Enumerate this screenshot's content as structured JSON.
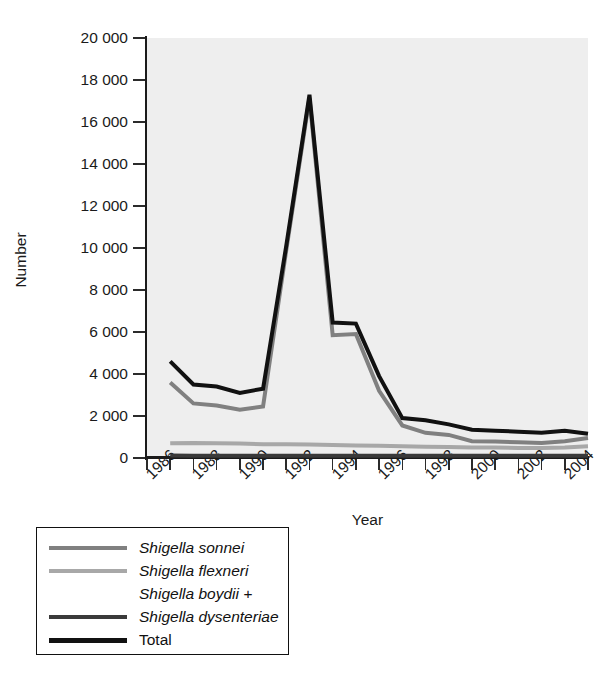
{
  "chart_data": {
    "type": "line",
    "title": "",
    "xlabel": "Year",
    "ylabel": "Number",
    "xlim": [
      1986,
      2005
    ],
    "ylim": [
      0,
      20000
    ],
    "grid": false,
    "legend_position": "below-left",
    "background": "#eeeeee",
    "x": [
      1987,
      1988,
      1989,
      1990,
      1991,
      1992,
      1993,
      1994,
      1995,
      1996,
      1997,
      1998,
      1999,
      2000,
      2001,
      2002,
      2003,
      2004,
      2005
    ],
    "xtick_labels": [
      "1986",
      "1988",
      "1990",
      "1992",
      "1994",
      "1996",
      "1998",
      "2000",
      "2002",
      "2004"
    ],
    "xtick_values": [
      1986,
      1988,
      1990,
      1992,
      1994,
      1996,
      1998,
      2000,
      2002,
      2004
    ],
    "xtick_all": [
      1986,
      1987,
      1988,
      1989,
      1990,
      1991,
      1992,
      1993,
      1994,
      1995,
      1996,
      1997,
      1998,
      1999,
      2000,
      2001,
      2002,
      2003,
      2004,
      2005
    ],
    "ytick_labels": [
      "0",
      "2000",
      "4000",
      "6000",
      "8000",
      "10000",
      "12000",
      "14000",
      "16000",
      "18000",
      "20000"
    ],
    "ytick_labels_display": [
      "0",
      "2 000",
      "4 000",
      "6 000",
      "8 000",
      "10 000",
      "12 000",
      "14 000",
      "16 000",
      "18 000",
      "20 000"
    ],
    "ytick_values": [
      0,
      2000,
      4000,
      6000,
      8000,
      10000,
      12000,
      14000,
      16000,
      18000,
      20000
    ],
    "series": [
      {
        "name": "Shigella sonnei",
        "italic": true,
        "color": "#808080",
        "width": 4,
        "values": [
          3600,
          2600,
          2500,
          2300,
          2450,
          9900,
          17150,
          5850,
          5900,
          3200,
          1550,
          1200,
          1100,
          800,
          780,
          750,
          720,
          800,
          950
        ]
      },
      {
        "name": "Shigella flexneri",
        "italic": true,
        "color": "#a8a8a8",
        "width": 4,
        "values": [
          700,
          720,
          700,
          690,
          660,
          650,
          640,
          620,
          600,
          580,
          560,
          540,
          520,
          500,
          500,
          480,
          480,
          500,
          560
        ]
      },
      {
        "name": "Shigella boydii + Shigella dysenteriae",
        "name_line1": "Shigella boydii +",
        "name_line2": "Shigella dysenteriae",
        "italic": true,
        "color": "#3a3a3a",
        "width": 4,
        "values": [
          120,
          110,
          110,
          110,
          110,
          110,
          110,
          110,
          110,
          110,
          110,
          110,
          110,
          110,
          110,
          110,
          110,
          110,
          110
        ]
      },
      {
        "name": "Total",
        "italic": false,
        "color": "#111111",
        "width": 4,
        "values": [
          4600,
          3500,
          3400,
          3100,
          3300,
          10100,
          17300,
          6450,
          6400,
          3900,
          1900,
          1800,
          1600,
          1350,
          1300,
          1250,
          1200,
          1300,
          1150
        ]
      }
    ],
    "legend_entries": [
      {
        "label": "Shigella sonnei",
        "color": "#808080",
        "italic": true,
        "lines": 1
      },
      {
        "label": "Shigella flexneri",
        "color": "#a8a8a8",
        "italic": true,
        "lines": 1
      },
      {
        "label": "Shigella boydii +",
        "label2": "Shigella dysenteriae",
        "color": "#3a3a3a",
        "italic": true,
        "lines": 2
      },
      {
        "label": "Total",
        "color": "#111111",
        "italic": false,
        "lines": 1
      }
    ]
  },
  "axes": {
    "y_title": "Number",
    "x_title": "Year"
  }
}
